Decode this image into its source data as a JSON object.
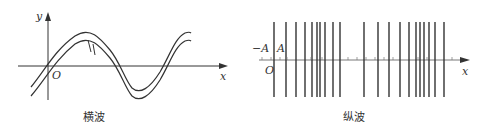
{
  "transverse": {
    "caption": "横波",
    "y_label": "y",
    "x_label": "x",
    "origin_label": "O"
  },
  "longitudinal": {
    "caption": "纵波",
    "x_label": "x",
    "origin_label": "O",
    "neg_amp_label": "−A",
    "pos_amp_label": "A",
    "line_positions": [
      274,
      286,
      296,
      305,
      312,
      317,
      320,
      325,
      333,
      340,
      364,
      378,
      389,
      400,
      409,
      416,
      420,
      424,
      429,
      435,
      444
    ]
  },
  "colors": {
    "stroke": "#333333"
  }
}
